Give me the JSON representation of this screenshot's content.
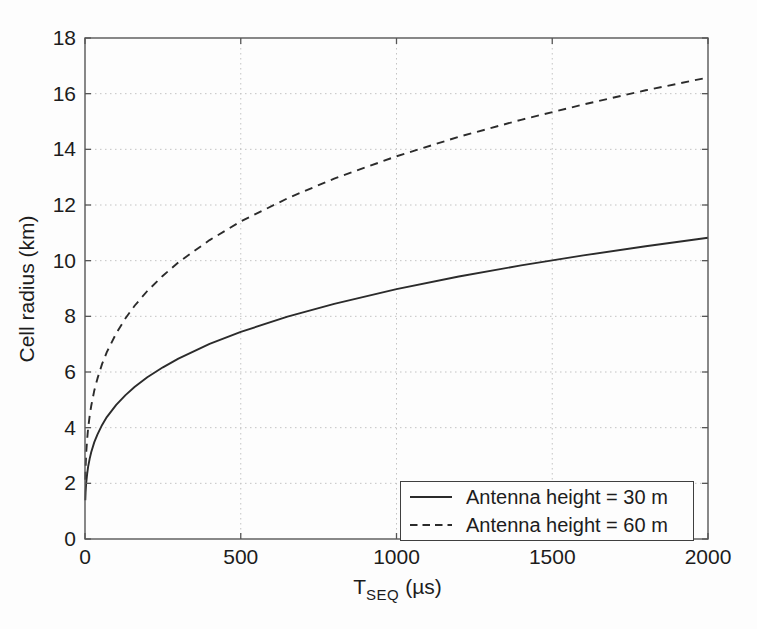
{
  "figure": {
    "background": "#fdfdfd",
    "frame_color": "#565656",
    "grid_color": "#c3c3c3",
    "tick_color": "#565656",
    "text_color": "#1c1c1c",
    "curve_color": "#2b2b2b"
  },
  "chart_data": {
    "type": "line",
    "title": "",
    "ylabel": "Cell radius (km)",
    "xlabel_main": "T",
    "xlabel_sub": "SEQ",
    "xlabel_unit": "(µs)",
    "xlim": [
      0,
      2000
    ],
    "ylim": [
      0,
      18
    ],
    "x_ticks": [
      0,
      500,
      1000,
      1500,
      2000
    ],
    "x_tick_labels": [
      "0",
      "500",
      "1000",
      "1500",
      "2000"
    ],
    "y_ticks": [
      0,
      2,
      4,
      6,
      8,
      10,
      12,
      14,
      16,
      18
    ],
    "y_tick_labels": [
      "0",
      "2",
      "4",
      "6",
      "8",
      "10",
      "12",
      "14",
      "16",
      "18"
    ],
    "grid": "dotted",
    "legend_position": "bottom-right",
    "x": [
      1,
      2,
      4,
      7,
      10,
      15,
      20,
      30,
      40,
      55,
      70,
      100,
      130,
      160,
      200,
      250,
      300,
      400,
      500,
      650,
      800,
      1000,
      1200,
      1400,
      1600,
      1800,
      2000
    ],
    "series": [
      {
        "name": "Antenna height = 30 m",
        "style": "solid",
        "values": [
          1.39,
          1.68,
          2.02,
          2.35,
          2.59,
          2.89,
          3.12,
          3.48,
          3.76,
          4.1,
          4.38,
          4.82,
          5.17,
          5.47,
          5.81,
          6.17,
          6.48,
          7.01,
          7.44,
          7.99,
          8.45,
          8.98,
          9.43,
          9.83,
          10.19,
          10.52,
          10.82
        ]
      },
      {
        "name": "Antenna height = 60 m",
        "style": "dashed",
        "values": [
          2.13,
          2.57,
          3.1,
          3.6,
          3.97,
          4.43,
          4.78,
          5.34,
          5.77,
          6.29,
          6.71,
          7.39,
          7.93,
          8.39,
          8.91,
          9.46,
          9.94,
          10.74,
          11.41,
          12.24,
          12.95,
          13.75,
          14.45,
          15.06,
          15.61,
          16.12,
          16.58
        ]
      }
    ]
  }
}
